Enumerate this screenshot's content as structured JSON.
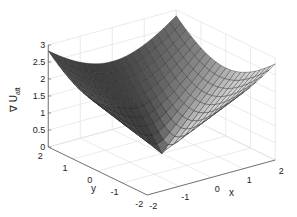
{
  "chart_data": {
    "type": "surface3d",
    "title": "",
    "function": "z = sqrt(x^2 + y^2)",
    "xlabel": "x",
    "ylabel": "y",
    "zlabel": "∇ U",
    "zlabel_subscript": "att",
    "xlim": [
      -2,
      2
    ],
    "ylim": [
      -2,
      2
    ],
    "zlim": [
      0,
      3
    ],
    "xticks": [
      "-2",
      "-1",
      "0",
      "1",
      "2"
    ],
    "yticks": [
      "-2",
      "-1",
      "0",
      "1",
      "2"
    ],
    "zticks": [
      "0",
      "0.5",
      "1",
      "1.5",
      "2",
      "2.5",
      "3"
    ],
    "grid": true,
    "colormap": "gray",
    "mesh_resolution": 21
  }
}
